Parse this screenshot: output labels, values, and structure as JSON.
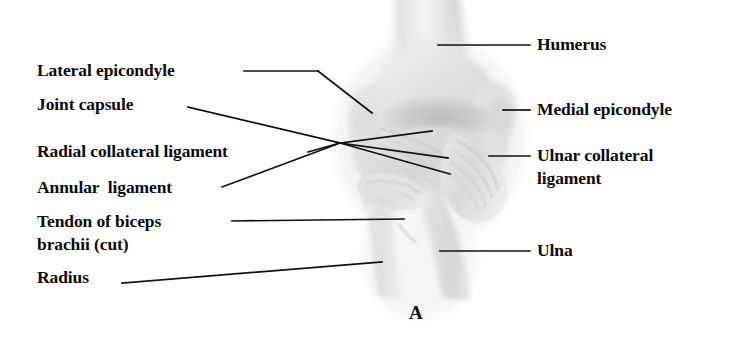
{
  "figure": {
    "letter": "A",
    "background_color": "#ffffff",
    "ink_color": "#0a0a0a",
    "art_style": "grayscale-pencil-anatomical-illustration"
  },
  "labels_left": [
    {
      "id": "lateral-epicondyle",
      "text": "Lateral epicondyle"
    },
    {
      "id": "joint-capsule",
      "text": "Joint capsule"
    },
    {
      "id": "radial-collateral-ligament",
      "text": "Radial collateral ligament"
    },
    {
      "id": "annular-ligament",
      "text": "Annular  ligament"
    },
    {
      "id": "tendon-of-biceps-brachii",
      "line1": "Tendon of biceps",
      "line2": "brachii (cut)"
    },
    {
      "id": "radius",
      "text": "Radius"
    }
  ],
  "labels_right": [
    {
      "id": "humerus",
      "text": "Humerus"
    },
    {
      "id": "medial-epicondyle",
      "text": "Medial epicondyle"
    },
    {
      "id": "ulnar-collateral-ligament",
      "line1": "Ulnar collateral",
      "line2": "ligament"
    },
    {
      "id": "ulna",
      "text": "Ulna"
    }
  ]
}
